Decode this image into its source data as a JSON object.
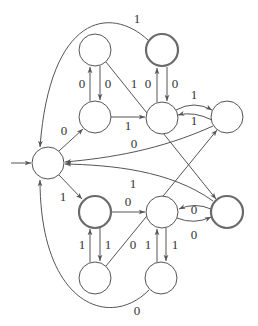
{
  "diagram": {
    "type": "finite-automaton",
    "colors": {
      "stroke": "#555555",
      "text": "#333333",
      "background": "#ffffff"
    },
    "start_state": "S",
    "states": [
      {
        "id": "S",
        "x": 48,
        "y": 163,
        "accepting": false
      },
      {
        "id": "A",
        "x": 95,
        "y": 50,
        "accepting": false
      },
      {
        "id": "B",
        "x": 162,
        "y": 50,
        "accepting": true
      },
      {
        "id": "E",
        "x": 95,
        "y": 117,
        "accepting": false
      },
      {
        "id": "C",
        "x": 162,
        "y": 118,
        "accepting": false
      },
      {
        "id": "D",
        "x": 227,
        "y": 117,
        "accepting": false
      },
      {
        "id": "F",
        "x": 95,
        "y": 212,
        "accepting": true
      },
      {
        "id": "G",
        "x": 162,
        "y": 212,
        "accepting": false
      },
      {
        "id": "H",
        "x": 227,
        "y": 212,
        "accepting": true
      },
      {
        "id": "I",
        "x": 95,
        "y": 278,
        "accepting": false
      },
      {
        "id": "J",
        "x": 161,
        "y": 278,
        "accepting": false
      }
    ],
    "transitions": [
      {
        "from": "B",
        "to": "S",
        "label": "1"
      },
      {
        "from": "S",
        "to": "E",
        "label": "0"
      },
      {
        "from": "E",
        "to": "A",
        "label": "0"
      },
      {
        "from": "A",
        "to": "E",
        "label": "0"
      },
      {
        "from": "A",
        "to": "H",
        "label": "1"
      },
      {
        "from": "E",
        "to": "C",
        "label": "1"
      },
      {
        "from": "C",
        "to": "B",
        "label": "0"
      },
      {
        "from": "B",
        "to": "C",
        "label": "0"
      },
      {
        "from": "C",
        "to": "D",
        "label": "1"
      },
      {
        "from": "D",
        "to": "C",
        "label": "1"
      },
      {
        "from": "D",
        "to": "S",
        "label": "0"
      },
      {
        "from": "H",
        "to": "S",
        "label": "1"
      },
      {
        "from": "S",
        "to": "F",
        "label": "1"
      },
      {
        "from": "F",
        "to": "G",
        "label": "0"
      },
      {
        "from": "H",
        "to": "G",
        "label": "0"
      },
      {
        "from": "G",
        "to": "H",
        "label": "0"
      },
      {
        "from": "I",
        "to": "F",
        "label": "1"
      },
      {
        "from": "F",
        "to": "I",
        "label": "1"
      },
      {
        "from": "I",
        "to": "D",
        "label": "0"
      },
      {
        "from": "J",
        "to": "G",
        "label": "1"
      },
      {
        "from": "G",
        "to": "J",
        "label": "1"
      },
      {
        "from": "J",
        "to": "S",
        "label": "0"
      }
    ]
  },
  "labels": {
    "B_S": "1",
    "S_E": "0",
    "E_A": "0",
    "A_E": "0",
    "A_H": "1",
    "E_C": "1",
    "C_B": "0",
    "B_C": "0",
    "C_D": "1",
    "D_C": "1",
    "D_S": "0",
    "H_S": "1",
    "S_F": "1",
    "F_G": "0",
    "H_G": "0",
    "G_H": "0",
    "I_F": "1",
    "F_I": "1",
    "I_D": "0",
    "J_G": "1",
    "G_J": "1",
    "J_S": "0"
  }
}
